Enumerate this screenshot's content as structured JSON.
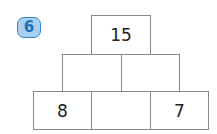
{
  "exercise": {
    "number": "6"
  },
  "pyramid": {
    "top": [
      "15"
    ],
    "middle": [
      "",
      ""
    ],
    "bottom": [
      "8",
      "",
      "7"
    ]
  },
  "colors": {
    "badge_fill": "#a9d0f0",
    "badge_border": "#3a86c8",
    "badge_text": "#1f6fb5",
    "cell_border": "#8a8a8a"
  }
}
